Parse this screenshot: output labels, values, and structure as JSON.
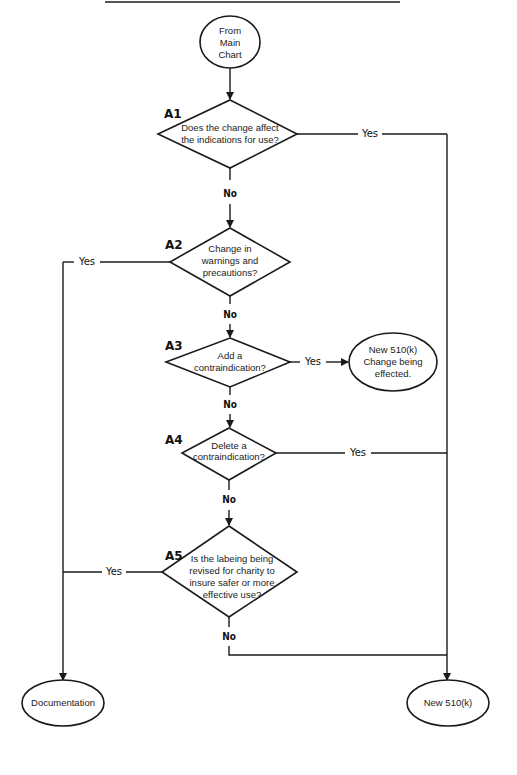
{
  "diagram": {
    "type": "flowchart",
    "start": {
      "id": "start",
      "lines": [
        "From",
        "Main",
        "Chart"
      ]
    },
    "decisions": [
      {
        "id": "A1",
        "label": "A1",
        "lines": [
          "Does the change affect",
          "the indications for use?"
        ],
        "yes_target": "new510k",
        "no_target": "A2"
      },
      {
        "id": "A2",
        "label": "A2",
        "lines": [
          "Change in",
          "warnings and",
          "precautions?"
        ],
        "yes_target": "documentation",
        "no_target": "A3"
      },
      {
        "id": "A3",
        "label": "A3",
        "lines": [
          "Add a",
          "contraindication?"
        ],
        "yes_target": "new510k_change",
        "no_target": "A4"
      },
      {
        "id": "A4",
        "label": "A4",
        "lines": [
          "Delete a",
          "contraindication?"
        ],
        "yes_target": "new510k",
        "no_target": "A5"
      },
      {
        "id": "A5",
        "label": "A5",
        "lines": [
          "Is the labeing being",
          "revised for charity to",
          "insure safer or more",
          "effective use?"
        ],
        "yes_target": "documentation",
        "no_target": "new510k"
      }
    ],
    "terminals": {
      "new510k_change": {
        "lines": [
          "New 510(k)",
          "Change being",
          "effected."
        ]
      },
      "documentation": {
        "lines": [
          "Documentation"
        ]
      },
      "new510k": {
        "lines": [
          "New 510(k)"
        ]
      }
    },
    "edge_labels": {
      "yes": "Yes",
      "no": "No"
    },
    "colors": {
      "stroke": "#1a1a1a",
      "background": "#ffffff",
      "text": "#222222"
    }
  }
}
